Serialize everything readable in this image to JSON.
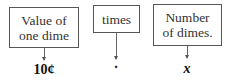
{
  "boxes": [
    {
      "label_line1": "Value of",
      "label_line2": "one dime",
      "value": "10¢"
    },
    {
      "label_line1": "times",
      "label_line2": "",
      "value": "·"
    },
    {
      "label_line1": "Number",
      "label_line2": "of dimes.",
      "value": "x"
    }
  ]
}
